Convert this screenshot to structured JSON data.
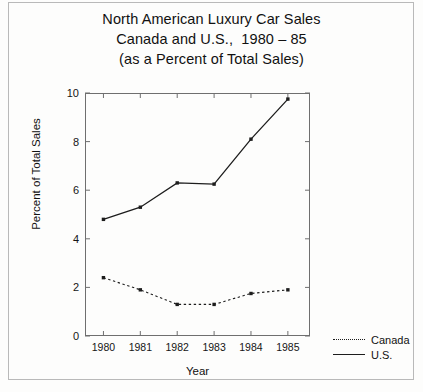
{
  "chart_data": {
    "type": "line",
    "title": "North American Luxury Car Sales\nCanada and U.S.,  1980 – 85\n(as a Percent of Total Sales)",
    "title_lines": [
      "North American Luxury Car Sales",
      "Canada and U.S.,  1980 – 85",
      "(as a Percent of Total Sales)"
    ],
    "xlabel": "Year",
    "ylabel": "Percent of Total Sales",
    "categories": [
      "1980",
      "1981",
      "1982",
      "1983",
      "1984",
      "1985"
    ],
    "x": [
      1980,
      1981,
      1982,
      1983,
      1984,
      1985
    ],
    "xlim": [
      1979.5,
      1985.6
    ],
    "ylim": [
      0,
      10
    ],
    "yticks": [
      0,
      2,
      4,
      6,
      8,
      10
    ],
    "ytick_labels": [
      "0",
      "2",
      "4",
      "6",
      "8",
      "10"
    ],
    "xticks": [
      1980,
      1981,
      1982,
      1983,
      1984,
      1985
    ],
    "grid": false,
    "legend_position": "right",
    "series": [
      {
        "name": "Canada",
        "style": "dashed",
        "color": "#1d1d1d",
        "marker": "square",
        "values": [
          2.4,
          1.9,
          1.3,
          1.3,
          1.75,
          1.9
        ]
      },
      {
        "name": "U.S.",
        "style": "solid",
        "color": "#1d1d1d",
        "marker": "square",
        "values": [
          4.8,
          5.3,
          6.3,
          6.25,
          8.1,
          9.75
        ]
      }
    ]
  },
  "legend": {
    "items": [
      {
        "label": "Canada",
        "style": "dashed"
      },
      {
        "label": "U.S.",
        "style": "solid"
      }
    ]
  },
  "colors": {
    "ink": "#1d1d1d",
    "axis": "#6f6f6f",
    "page": "#fdfdfc",
    "frame": "#b9b9b9"
  }
}
